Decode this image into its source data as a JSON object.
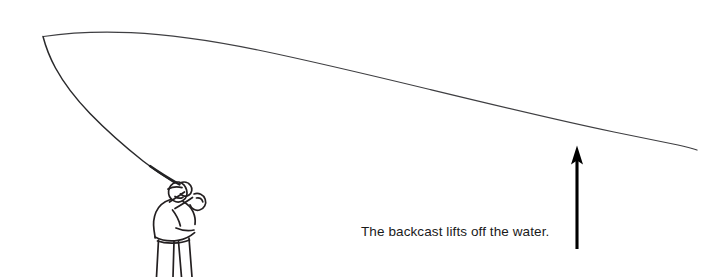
{
  "figure": {
    "caption": "The backcast lifts off the water.",
    "background_color": "#ffffff",
    "ink_color": "#231f20",
    "arrow": {
      "name": "up-arrow",
      "direction": "up",
      "tip_x": 577,
      "tip_y": 146,
      "tail_x": 577,
      "tail_y": 249,
      "color": "#000000"
    },
    "angler": {
      "name": "fly-fisherman",
      "description": "Line drawing of an angler seen from behind holding a fly rod raised to the upper left",
      "color": "#231f20"
    },
    "fly_line": {
      "name": "fly-line-loop",
      "description": "Fly line forming an open loop with its tip at the upper left, the upper leg trailing down to the right edge and the lower leg running down to the rod tip",
      "loop_tip_x": 43,
      "loop_tip_y": 36,
      "upper_leg_end_x": 697,
      "upper_leg_end_y": 150,
      "lower_leg_end_x": 178,
      "lower_leg_end_y": 182,
      "color": "#3a3a3c"
    }
  }
}
